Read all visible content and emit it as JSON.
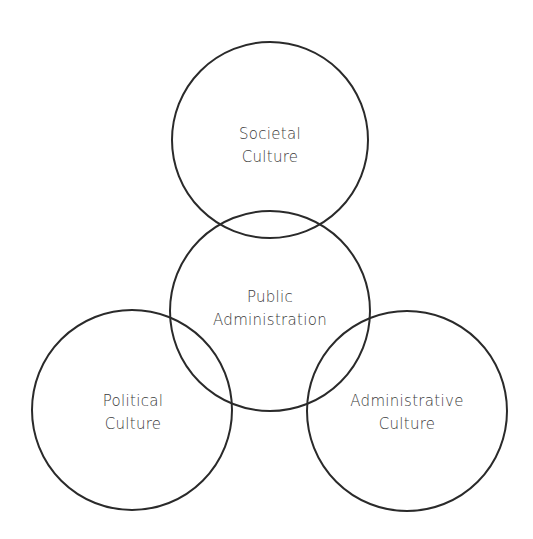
{
  "diagram": {
    "type": "overlapping-circles",
    "line_color": "#2a2a2a",
    "text_color": "#3a3a3a",
    "nodes": [
      {
        "id": "societal",
        "lines": [
          "Societal",
          "Culture"
        ],
        "cx": 270,
        "cy": 140,
        "r": 99
      },
      {
        "id": "public",
        "lines": [
          "Public",
          "Administration"
        ],
        "cx": 270,
        "cy": 311,
        "r": 101
      },
      {
        "id": "political",
        "lines": [
          "Political",
          "Culture"
        ],
        "cx": 132,
        "cy": 410,
        "r": 101
      },
      {
        "id": "administrative",
        "lines": [
          "Administrative",
          "Culture"
        ],
        "cx": 407,
        "cy": 411,
        "r": 101
      }
    ]
  }
}
